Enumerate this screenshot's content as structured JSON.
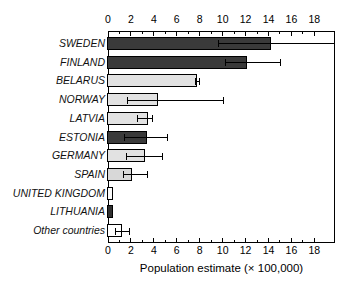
{
  "chart_data": {
    "type": "bar",
    "orientation": "horizontal",
    "title": "",
    "xlabel": "Population estimate (× 100,000)",
    "ylabel": "",
    "xlim": [
      0,
      19.8
    ],
    "grid": false,
    "legend": null,
    "xticks": [
      0,
      2,
      4,
      6,
      8,
      10,
      12,
      14,
      16,
      18
    ],
    "xtick_labels": [
      "0",
      "2",
      "4",
      "6",
      "8",
      "10",
      "12",
      "14",
      "16",
      "18"
    ],
    "xtick_minor_step": 1,
    "axis_positions": [
      "top",
      "bottom"
    ],
    "categories": [
      "SWEDEN",
      "FINLAND",
      "BELARUS",
      "NORWAY",
      "LATVIA",
      "ESTONIA",
      "GERMANY",
      "SPAIN",
      "UNITED KINGDOM",
      "LITHUANIA",
      "Other countries"
    ],
    "values": [
      14.2,
      12.1,
      7.8,
      4.4,
      3.5,
      3.4,
      3.2,
      2.1,
      0.45,
      0.4,
      1.2
    ],
    "error_low": [
      9.6,
      10.2,
      7.6,
      1.7,
      2.5,
      1.4,
      1.6,
      1.3,
      0.45,
      0.4,
      0.6
    ],
    "error_high": [
      19.8,
      15.1,
      8.0,
      10.1,
      3.9,
      5.2,
      4.8,
      3.5,
      0.45,
      0.4,
      1.9
    ],
    "bar_colors": [
      "#3a3a3a",
      "#3a3a3a",
      "#e2e2e2",
      "#e2e2e2",
      "#e2e2e2",
      "#3a3a3a",
      "#e2e2e2",
      "#d8d8d8",
      "#fafafa",
      "#303030",
      "#ffffff"
    ],
    "edge_color": "#000000",
    "error_color": "#000000"
  }
}
